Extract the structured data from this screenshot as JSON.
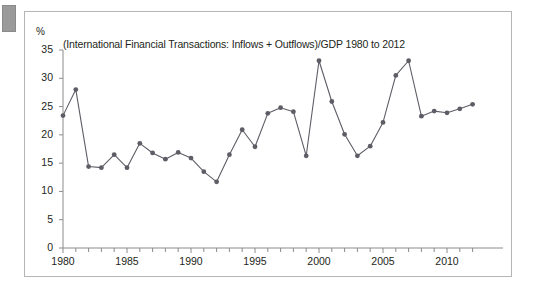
{
  "figure": {
    "corner_mark": "grey-tab",
    "frame_color": "#b5b5b5",
    "background": "#ffffff"
  },
  "chart_data": {
    "type": "line",
    "title": "(International Financial Transactions: Inflows + Outflows)/GDP 1980 to 2012",
    "xlabel": "",
    "ylabel": "%",
    "y_unit_label": "%",
    "series_color": "#5d5d66",
    "marker": "circle",
    "grid": false,
    "legend": "none",
    "xlim": [
      1980,
      2012
    ],
    "ylim": [
      0,
      35
    ],
    "ytick_values": [
      0,
      5,
      10,
      15,
      20,
      25,
      30,
      35
    ],
    "ytick_labels": [
      "0",
      "5",
      "10",
      "15",
      "20",
      "25",
      "30",
      "35"
    ],
    "xtick_values": [
      1980,
      1985,
      1990,
      1995,
      2000,
      2005,
      2010
    ],
    "xtick_labels": [
      "1980",
      "1985",
      "1990",
      "1995",
      "2000",
      "2005",
      "2010"
    ],
    "x_minor_ticks_every": 1,
    "x": [
      1980,
      1981,
      1982,
      1983,
      1984,
      1985,
      1986,
      1987,
      1988,
      1989,
      1990,
      1991,
      1992,
      1993,
      1994,
      1995,
      1996,
      1997,
      1998,
      1999,
      2000,
      2001,
      2002,
      2003,
      2004,
      2005,
      2006,
      2007,
      2008,
      2009,
      2010,
      2011,
      2012
    ],
    "values": [
      23.4,
      28.0,
      14.4,
      14.2,
      16.5,
      14.2,
      18.5,
      16.8,
      15.7,
      16.9,
      15.9,
      13.5,
      11.7,
      16.5,
      20.9,
      17.9,
      23.8,
      24.8,
      24.1,
      16.3,
      33.1,
      25.9,
      20.1,
      16.3,
      18.0,
      22.2,
      30.5,
      33.1,
      23.3,
      24.2,
      23.9,
      24.6,
      25.4
    ]
  }
}
